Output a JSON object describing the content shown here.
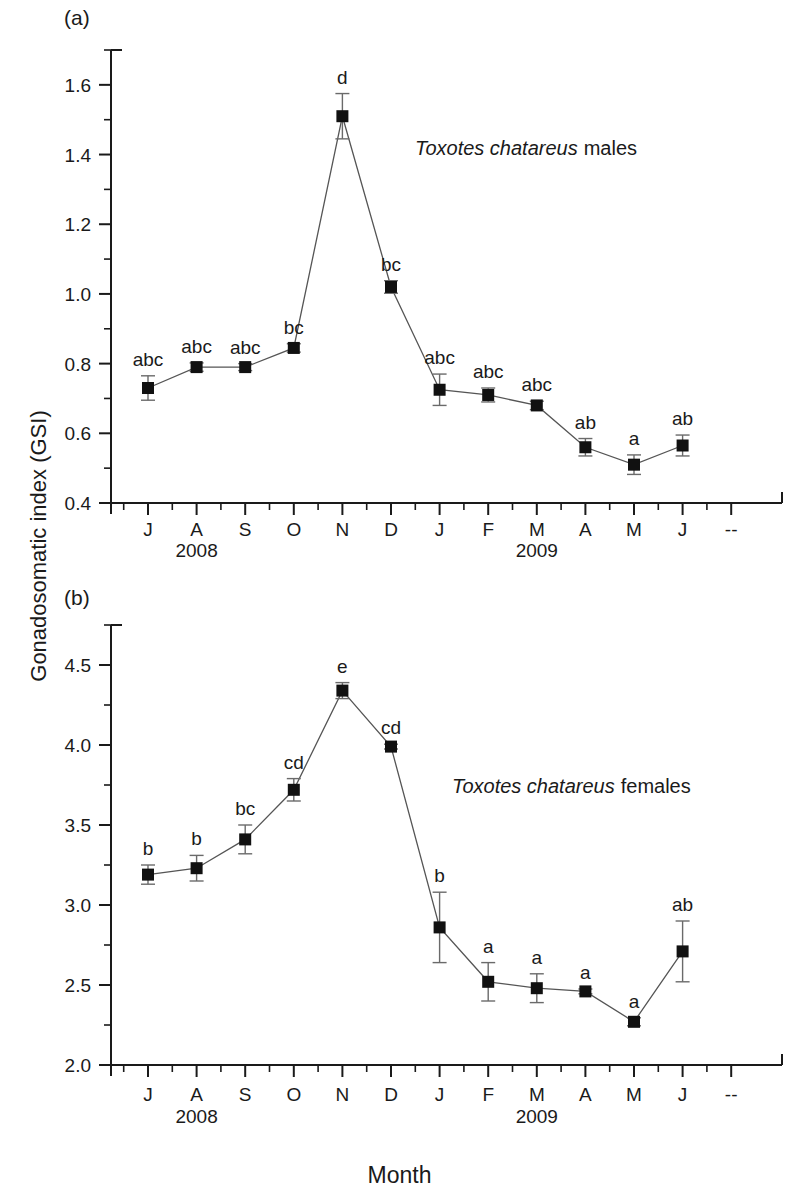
{
  "figure": {
    "y_axis_title": "Gonadosomatic index (GSI)",
    "x_axis_title": "Month",
    "panel_a_letter": "(a)",
    "panel_b_letter": "(b)",
    "axis_end_mark": "--"
  },
  "chart_data": [
    {
      "type": "line",
      "panel": "(a)",
      "title": "Toxotes chatareus males",
      "title_italic_part": "Toxotes chatareus",
      "title_roman_part": "males",
      "xlabel": "Month",
      "ylabel": "Gonadosomatic index (GSI)",
      "ylim": [
        0.4,
        1.7
      ],
      "ytick_labels": [
        "0.4",
        "0.6",
        "0.8",
        "1.0",
        "1.2",
        "1.4",
        "1.6"
      ],
      "yticks": [
        0.4,
        0.6,
        0.8,
        1.0,
        1.2,
        1.4,
        1.6
      ],
      "yminor_step": 0.1,
      "grid": false,
      "legend": "none",
      "categories": [
        "J",
        "A",
        "S",
        "O",
        "N",
        "D",
        "J",
        "F",
        "M",
        "A",
        "M",
        "J"
      ],
      "year_groups": [
        {
          "label": "2008",
          "center_category_index": 1
        },
        {
          "label": "2009",
          "center_category_index": 8
        }
      ],
      "values": [
        0.73,
        0.79,
        0.79,
        0.845,
        1.51,
        1.02,
        0.725,
        0.71,
        0.68,
        0.56,
        0.51,
        0.565
      ],
      "errors": [
        0.035,
        0.012,
        0.01,
        0.012,
        0.065,
        0.018,
        0.045,
        0.02,
        0.012,
        0.025,
        0.028,
        0.03
      ],
      "annotations": [
        "abc",
        "abc",
        "abc",
        "bc",
        "d",
        "bc",
        "abc",
        "abc",
        "abc",
        "ab",
        "a",
        "ab"
      ]
    },
    {
      "type": "line",
      "panel": "(b)",
      "title": "Toxotes chatareus females",
      "title_italic_part": "Toxotes chatareus",
      "title_roman_part": "females",
      "xlabel": "Month",
      "ylabel": "Gonadosomatic index (GSI)",
      "ylim": [
        2.0,
        4.75
      ],
      "ytick_labels": [
        "2.0",
        "2.5",
        "3.0",
        "3.5",
        "4.0",
        "4.5"
      ],
      "yticks": [
        2.0,
        2.5,
        3.0,
        3.5,
        4.0,
        4.5
      ],
      "yminor_step": 0.25,
      "grid": false,
      "legend": "none",
      "categories": [
        "J",
        "A",
        "S",
        "O",
        "N",
        "D",
        "J",
        "F",
        "M",
        "A",
        "M",
        "J"
      ],
      "year_groups": [
        {
          "label": "2008",
          "center_category_index": 1
        },
        {
          "label": "2009",
          "center_category_index": 8
        }
      ],
      "values": [
        3.19,
        3.23,
        3.41,
        3.72,
        4.34,
        3.99,
        2.86,
        2.52,
        2.48,
        2.46,
        2.27,
        2.71
      ],
      "errors": [
        0.06,
        0.08,
        0.09,
        0.07,
        0.05,
        0.015,
        0.22,
        0.12,
        0.09,
        0.015,
        0.025,
        0.19
      ],
      "annotations": [
        "b",
        "b",
        "bc",
        "cd",
        "e",
        "cd",
        "b",
        "a",
        "a",
        "a",
        "a",
        "ab"
      ]
    }
  ]
}
